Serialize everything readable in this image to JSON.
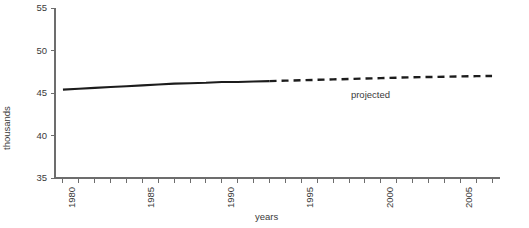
{
  "chart_data": {
    "type": "line",
    "title": "",
    "xlabel": "years",
    "ylabel": "thousands",
    "xlim": [
      1979.5,
      2007.5
    ],
    "ylim": [
      35,
      55
    ],
    "grid": false,
    "legend": null,
    "yticks": [
      35,
      40,
      45,
      50,
      55
    ],
    "ytick_labels": [
      "35",
      "40",
      "45",
      "50",
      "55"
    ],
    "xticks": [
      1980,
      1981,
      1982,
      1983,
      1984,
      1985,
      1986,
      1987,
      1988,
      1989,
      1990,
      1991,
      1992,
      1993,
      1994,
      1995,
      1996,
      1997,
      1998,
      1999,
      2000,
      2001,
      2002,
      2003,
      2004,
      2005,
      2006,
      2007
    ],
    "xtick_labels": [
      {
        "value": 1980,
        "label": "1980"
      },
      {
        "value": 1985,
        "label": "1985"
      },
      {
        "value": 1990,
        "label": "1990"
      },
      {
        "value": 1995,
        "label": "1995"
      },
      {
        "value": 2000,
        "label": "2000"
      },
      {
        "value": 2005,
        "label": "2005"
      }
    ],
    "annotations": [
      {
        "text": "projected",
        "x": 1999.0,
        "y": 44.9
      }
    ],
    "series": [
      {
        "name": "actual",
        "style": "solid",
        "color": "#1c1c1c",
        "x": [
          1980,
          1981,
          1982,
          1983,
          1984,
          1985,
          1986,
          1987,
          1988,
          1989,
          1990,
          1991,
          1992,
          1993
        ],
        "values": [
          45.4,
          45.5,
          45.6,
          45.7,
          45.8,
          45.9,
          46.0,
          46.1,
          46.15,
          46.2,
          46.3,
          46.3,
          46.35,
          46.4
        ]
      },
      {
        "name": "projected",
        "style": "dashed",
        "color": "#1c1c1c",
        "x": [
          1993,
          1994,
          1995,
          1996,
          1997,
          1998,
          1999,
          2000,
          2001,
          2002,
          2003,
          2004,
          2005,
          2006,
          2007
        ],
        "values": [
          46.4,
          46.45,
          46.5,
          46.55,
          46.6,
          46.65,
          46.7,
          46.75,
          46.8,
          46.85,
          46.88,
          46.92,
          46.95,
          46.98,
          47.0
        ]
      }
    ]
  }
}
